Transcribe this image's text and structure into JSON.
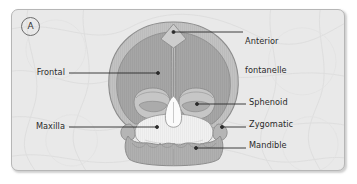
{
  "figure": {
    "panel_letter": "A",
    "background_color": "#e9e9e9",
    "border_color": "#b6b6b6",
    "bone_fill_color": "#a6a6a6",
    "bone_rim_color": "#c2c2c2",
    "maxilla_fill_color": "#f1f1f1",
    "outline_color": "#8a8a8a",
    "label_text_color": "#2b2b2b",
    "leader_line_color": "#2b2b2b"
  },
  "labels": {
    "anterior_fontanelle": {
      "line1": "Anterior",
      "line2": "fontanelle",
      "side": "right"
    },
    "sphenoid": {
      "text": "Sphenoid",
      "side": "right"
    },
    "zygomatic": {
      "text": "Zygomatic",
      "side": "right"
    },
    "mandible": {
      "text": "Mandible",
      "side": "right"
    },
    "frontal": {
      "text": "Frontal",
      "side": "left"
    },
    "maxilla": {
      "text": "Maxilla",
      "side": "left"
    }
  }
}
